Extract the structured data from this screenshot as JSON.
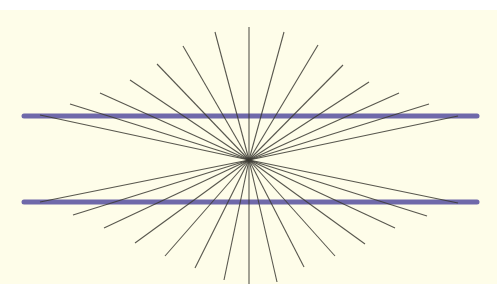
{
  "figure": {
    "width": 497,
    "height": 284,
    "colors": {
      "page": "#ffffff",
      "background": "#fefde9",
      "parallel_lines": "#6f69aa",
      "ray_lines": "#3b3a33"
    },
    "background_rect": {
      "x": 0,
      "y": 10,
      "width": 497,
      "height": 274
    },
    "center": {
      "x": 249,
      "y": 160
    },
    "parallel_lines": [
      {
        "name": "top-horizontal-line",
        "x1": 24,
        "y1": 116,
        "x2": 477,
        "y2": 116,
        "stroke_width": 5
      },
      {
        "name": "bottom-horizontal-line",
        "x1": 24,
        "y1": 202,
        "x2": 477,
        "y2": 202,
        "stroke_width": 5
      }
    ],
    "ray_endpoints": [
      [
        40,
        115
      ],
      [
        70,
        104
      ],
      [
        100,
        93
      ],
      [
        130,
        80
      ],
      [
        157,
        64
      ],
      [
        183,
        46
      ],
      [
        215,
        32
      ],
      [
        249,
        27
      ],
      [
        284,
        32
      ],
      [
        318,
        45
      ],
      [
        343,
        65
      ],
      [
        369,
        82
      ],
      [
        399,
        93
      ],
      [
        429,
        104
      ],
      [
        458,
        116
      ],
      [
        40,
        202
      ],
      [
        73,
        215
      ],
      [
        104,
        228
      ],
      [
        135,
        243
      ],
      [
        165,
        256
      ],
      [
        195,
        268
      ],
      [
        224,
        280
      ],
      [
        249,
        284
      ],
      [
        277,
        282
      ],
      [
        304,
        267
      ],
      [
        335,
        256
      ],
      [
        365,
        244
      ],
      [
        395,
        228
      ],
      [
        427,
        216
      ],
      [
        458,
        203
      ]
    ],
    "ray_stroke_width": 1.1
  }
}
